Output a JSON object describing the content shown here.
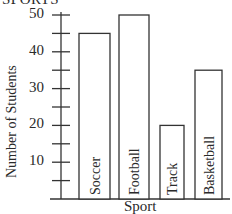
{
  "chart_data": {
    "type": "bar",
    "title": "SPORTS",
    "xlabel": "Sport",
    "ylabel": "Number of Students",
    "categories": [
      "Soccer",
      "Football",
      "Track",
      "Basketball"
    ],
    "values": [
      45,
      50,
      20,
      35
    ],
    "ylim": [
      0,
      50
    ],
    "yticks_labeled": [
      10,
      20,
      30,
      40,
      50
    ],
    "yticks_minor_step": 5,
    "grid": false,
    "legend": null,
    "bar_label_position": "inside, rotated vertical"
  },
  "labels": {
    "title": "SPORTS",
    "xlabel": "Sport",
    "ylabel": "Number of Students",
    "ticks": [
      "10",
      "20",
      "30",
      "40",
      "50"
    ],
    "bars": [
      "Soccer",
      "Football",
      "Track",
      "Basketball"
    ]
  },
  "colors": {
    "stroke": "#333333",
    "fill": "#ffffff",
    "text": "#2a2a2a"
  }
}
